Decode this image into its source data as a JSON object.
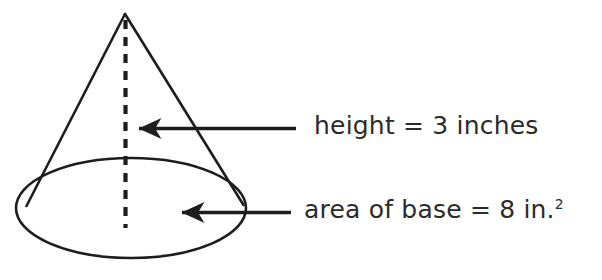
{
  "figure": {
    "kind": "cone-geometry-diagram",
    "background_color": "#ffffff",
    "stroke_color": "#1d1d1d",
    "text_color": "#2b2b2b",
    "shape": {
      "name": "cone",
      "apex": {
        "x": 125,
        "y": 14
      },
      "left_base_contact": {
        "x": 27,
        "y": 205
      },
      "right_base_contact": {
        "x": 243,
        "y": 205
      },
      "base_ellipse": {
        "cx": 131,
        "cy": 208,
        "rx": 115,
        "ry": 50
      },
      "height_line": {
        "x": 125,
        "y_top": 20,
        "y_bottom": 228,
        "style": "dashed"
      }
    },
    "arrows": [
      {
        "name": "height-arrow",
        "tip": {
          "x": 132,
          "y": 128
        },
        "tail": {
          "x": 296,
          "y": 128
        },
        "direction": "left"
      },
      {
        "name": "base-arrow",
        "tip": {
          "x": 175,
          "y": 212
        },
        "tail": {
          "x": 291,
          "y": 212
        },
        "direction": "left"
      }
    ]
  },
  "labels": {
    "height": {
      "text": "height = 3 inches",
      "quantity": 3,
      "unit": "inches",
      "measure": "height"
    },
    "area": {
      "text_main": "area of base = 8 in.",
      "exponent": "2",
      "quantity": 8,
      "unit": "in.",
      "measure": "area of base"
    }
  }
}
